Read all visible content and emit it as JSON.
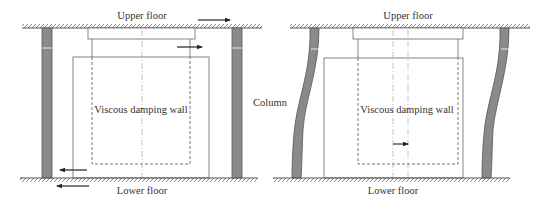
{
  "diagram": {
    "colors": {
      "line": "#555555",
      "column_fill": "#8a8a8a",
      "column_stroke": "#555555",
      "hatch": "#666666",
      "dashed": "#666666",
      "centerline": "#aaaaaa",
      "arrow": "#222222",
      "text": "#333333"
    },
    "left_panel": {
      "upper_floor_label": "Upper floor",
      "lower_floor_label": "Lower floor",
      "wall_label": "Viscous damping wall",
      "state": "undeformed",
      "arrows": [
        {
          "position": "above upper floor",
          "direction": "right"
        },
        {
          "position": "upper plate of wall",
          "direction": "right"
        },
        {
          "position": "above lower floor",
          "direction": "left"
        },
        {
          "position": "below lower floor",
          "direction": "left"
        }
      ]
    },
    "right_panel": {
      "upper_floor_label": "Upper floor",
      "lower_floor_label": "Lower floor",
      "wall_label": "Viscous damping wall",
      "state": "deformed",
      "arrows": [
        {
          "position": "inside wall, lower",
          "direction": "right"
        }
      ]
    },
    "column_label": "Column"
  }
}
